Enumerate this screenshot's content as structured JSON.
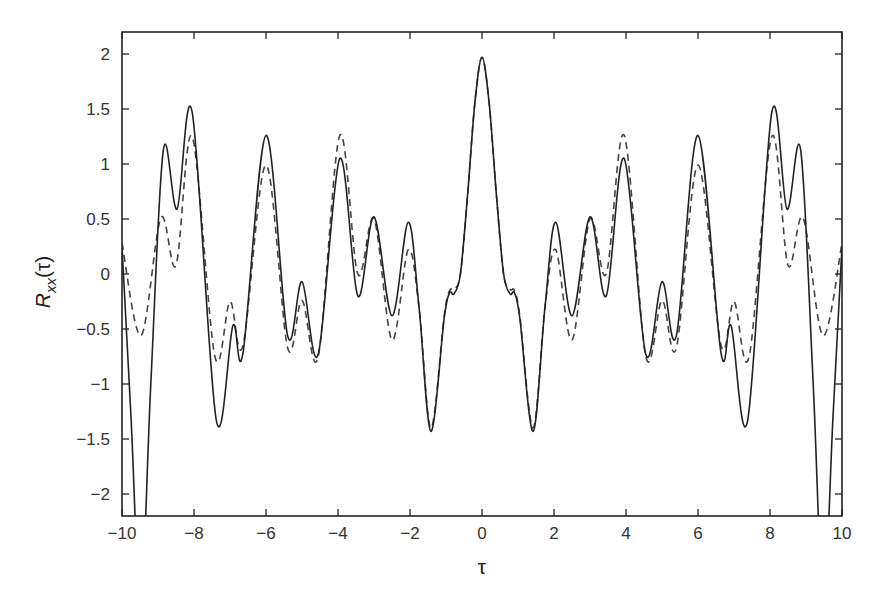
{
  "chart_data": {
    "type": "line",
    "title": "",
    "xlabel": "τ",
    "ylabel": "R_xx(τ)",
    "ylabel_parts": {
      "main": "R",
      "sub": "xx",
      "arg": "(τ)"
    },
    "xlim": [
      -10,
      10
    ],
    "ylim": [
      -2.2,
      2.2
    ],
    "grid": false,
    "legend": null,
    "x_ticks": [
      -10,
      -8,
      -6,
      -4,
      -2,
      0,
      2,
      4,
      6,
      8,
      10
    ],
    "x_tick_labels": [
      "−10",
      "−8",
      "−6",
      "−4",
      "−2",
      "0",
      "2",
      "4",
      "6",
      "8",
      "10"
    ],
    "y_ticks": [
      -2,
      -1.5,
      -1,
      -0.5,
      0,
      0.5,
      1,
      1.5,
      2
    ],
    "y_tick_labels": [
      "−2",
      "−1.5",
      "−1",
      "−0.5",
      "0",
      "0.5",
      "1",
      "1.5",
      "2"
    ],
    "symmetric_about_zero": true,
    "series": [
      {
        "name": "solid",
        "style": "solid",
        "color": "#222222",
        "x": [
          0,
          0.2,
          0.4,
          0.6,
          0.78,
          0.9,
          1.05,
          1.42,
          1.75,
          2.05,
          2.5,
          3.0,
          3.45,
          3.95,
          4.55,
          5.0,
          5.4,
          6.0,
          6.64,
          6.92,
          7.38,
          8.05,
          8.47,
          8.85,
          9.2,
          9.48,
          9.75,
          10
        ],
        "values": [
          1.97,
          1.55,
          0.72,
          0.0,
          -0.18,
          -0.17,
          -0.4,
          -1.43,
          -0.3,
          0.47,
          -0.38,
          0.52,
          -0.2,
          1.05,
          -0.73,
          -0.07,
          -0.56,
          1.26,
          -0.72,
          -0.47,
          -1.33,
          1.47,
          0.59,
          1.13,
          -1.0,
          -3.0,
          -1.3,
          0.25
        ]
      },
      {
        "name": "dashed",
        "style": "dashed",
        "color": "#444444",
        "x": [
          0,
          0.2,
          0.4,
          0.6,
          0.78,
          0.9,
          1.05,
          1.42,
          1.75,
          2.05,
          2.5,
          3.0,
          3.45,
          3.95,
          4.55,
          5.0,
          5.4,
          6.0,
          6.64,
          7.0,
          7.42,
          8.05,
          8.5,
          8.92,
          9.47,
          10
        ],
        "values": [
          1.97,
          1.55,
          0.72,
          0.0,
          -0.14,
          -0.15,
          -0.38,
          -1.4,
          -0.3,
          0.22,
          -0.6,
          0.5,
          0.0,
          1.26,
          -0.75,
          -0.24,
          -0.67,
          0.99,
          -0.65,
          -0.25,
          -0.75,
          1.25,
          0.08,
          0.51,
          -0.56,
          0.28
        ]
      }
    ]
  }
}
